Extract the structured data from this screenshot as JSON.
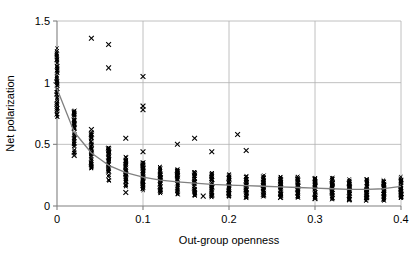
{
  "chart_data": {
    "type": "scatter",
    "title": "",
    "xlabel": "Out-group openness",
    "ylabel": "Net polarization",
    "xlim": [
      0,
      0.4
    ],
    "ylim": [
      0,
      1.5
    ],
    "xticks": [
      0,
      0.1,
      0.2,
      0.3,
      0.4
    ],
    "xtick_labels": [
      "0",
      "0.1",
      "0.2",
      "0.3",
      "0.4"
    ],
    "yticks": [
      0,
      0.5,
      1,
      1.5
    ],
    "ytick_labels": [
      "0",
      "0.5",
      "1",
      "1.5"
    ],
    "grid": true,
    "legend": "none",
    "marker": "x",
    "marker_color": "#000000",
    "fit_line_color": "#808080",
    "grid_color": "#b0b0b0",
    "axis_color": "#808080",
    "series": [
      {
        "name": "Net polarization vs Out-group openness",
        "x": [
          0,
          0.02,
          0.04,
          0.06,
          0.08,
          0.1,
          0.12,
          0.14,
          0.16,
          0.18,
          0.2,
          0.22,
          0.24,
          0.26,
          0.28,
          0.3,
          0.32,
          0.34,
          0.36,
          0.38,
          0.4
        ],
        "y_median": [
          1.02,
          0.62,
          0.44,
          0.33,
          0.27,
          0.23,
          0.21,
          0.19,
          0.18,
          0.17,
          0.165,
          0.16,
          0.155,
          0.15,
          0.145,
          0.14,
          0.135,
          0.13,
          0.125,
          0.12,
          0.14
        ],
        "y_min": [
          0.7,
          0.42,
          0.3,
          0.2,
          0.15,
          0.12,
          0.1,
          0.09,
          0.08,
          0.07,
          0.07,
          0.06,
          0.06,
          0.05,
          0.05,
          0.05,
          0.05,
          0.04,
          0.04,
          0.04,
          0.05
        ],
        "y_max": [
          1.28,
          0.78,
          0.6,
          0.48,
          0.4,
          0.36,
          0.32,
          0.3,
          0.28,
          0.27,
          0.26,
          0.25,
          0.25,
          0.24,
          0.24,
          0.23,
          0.23,
          0.22,
          0.22,
          0.21,
          0.24
        ],
        "spread_counts": [
          90,
          70,
          70,
          70,
          70,
          70,
          60,
          60,
          60,
          60,
          60,
          60,
          60,
          60,
          60,
          60,
          60,
          60,
          60,
          60,
          60
        ]
      }
    ],
    "fit_curve": {
      "name": "fitted decay curve",
      "x": [
        0,
        0.02,
        0.04,
        0.06,
        0.08,
        0.1,
        0.12,
        0.14,
        0.16,
        0.18,
        0.2,
        0.22,
        0.24,
        0.26,
        0.28,
        0.3,
        0.32,
        0.34,
        0.36,
        0.38,
        0.4
      ],
      "y": [
        0.95,
        0.6,
        0.43,
        0.33,
        0.27,
        0.235,
        0.21,
        0.195,
        0.185,
        0.175,
        0.17,
        0.165,
        0.16,
        0.155,
        0.15,
        0.145,
        0.14,
        0.135,
        0.135,
        0.14,
        0.16
      ]
    },
    "outliers": [
      {
        "x": 0.04,
        "y": 1.36
      },
      {
        "x": 0.06,
        "y": 1.31
      },
      {
        "x": 0.06,
        "y": 1.12
      },
      {
        "x": 0.1,
        "y": 1.05
      },
      {
        "x": 0.1,
        "y": 0.81
      },
      {
        "x": 0.1,
        "y": 0.78
      },
      {
        "x": 0.02,
        "y": 0.63
      },
      {
        "x": 0.04,
        "y": 0.62
      },
      {
        "x": 0.02,
        "y": 0.41
      },
      {
        "x": 0.08,
        "y": 0.55
      },
      {
        "x": 0.1,
        "y": 0.44
      },
      {
        "x": 0.08,
        "y": 0.11
      },
      {
        "x": 0.14,
        "y": 0.5
      },
      {
        "x": 0.16,
        "y": 0.55
      },
      {
        "x": 0.18,
        "y": 0.44
      },
      {
        "x": 0.21,
        "y": 0.58
      },
      {
        "x": 0.22,
        "y": 0.45
      },
      {
        "x": 0.2,
        "y": 0.1
      },
      {
        "x": 0.17,
        "y": 0.08
      },
      {
        "x": 0.26,
        "y": 0.07
      },
      {
        "x": 0.3,
        "y": 0.06
      },
      {
        "x": 0.34,
        "y": 0.05
      }
    ]
  },
  "labels": {
    "x_axis_title": "Out-group openness",
    "y_axis_title": "Net polarization"
  }
}
